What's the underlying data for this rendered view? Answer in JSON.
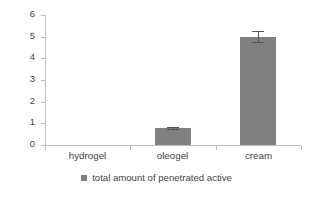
{
  "chart_data": {
    "type": "bar",
    "title": "",
    "subtitle": "",
    "xlabel": "",
    "ylabel": "Amount of penetrated avtie [µg]",
    "categories": [
      "hydrogel",
      "oleogel",
      "cream"
    ],
    "series": [
      {
        "name": "total amount of penetrated active",
        "values": [
          0,
          0.8,
          5.0
        ],
        "errors": [
          0,
          0.05,
          0.25
        ],
        "color": "#808080"
      }
    ],
    "ylim": [
      0,
      6
    ],
    "ytick_labels": [
      "0",
      "1",
      "2",
      "3",
      "4",
      "5",
      "6"
    ],
    "ytick_values": [
      0,
      1,
      2,
      3,
      4,
      5,
      6
    ],
    "grid": false,
    "legend_position": "bottom-center",
    "legend_entries": [
      {
        "label": "total amount of penetrated active",
        "color": "#808080"
      }
    ],
    "axis_color": "#bdbdbd",
    "error_bar_color": "#555555",
    "background": "#ffffff"
  }
}
